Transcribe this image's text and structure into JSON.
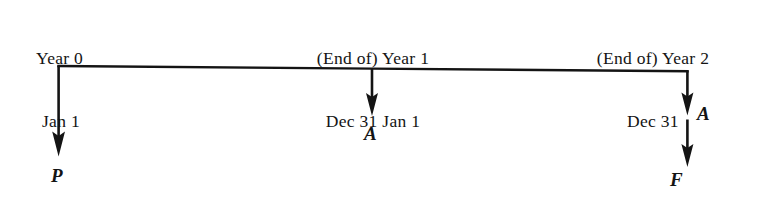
{
  "diagram": {
    "kind": "cash-flow-timeline",
    "ink_color": "#141414",
    "background_color": "#ffffff",
    "timeline": {
      "axis_y": 67,
      "start_x": 58,
      "end_x": 687
    },
    "period_labels": [
      {
        "id": "year0",
        "line1": "Year 0",
        "line2": "Jan 1",
        "align": "left"
      },
      {
        "id": "year1",
        "line1": "(End of) Year 1",
        "line2": "Dec 31 Jan 1",
        "align": "center"
      },
      {
        "id": "year2",
        "line1": "(End of) Year 2",
        "line2": "Dec 31",
        "align": "center"
      }
    ],
    "cash_flows": [
      {
        "id": "p",
        "symbol": "P",
        "meaning": "present-worth",
        "at_x": 58,
        "tip_y": 153,
        "label_position": "below"
      },
      {
        "id": "a-year1",
        "symbol": "A",
        "meaning": "annual-amount",
        "at_x": 372,
        "tip_y": 113,
        "label_position": "below"
      },
      {
        "id": "a-year2",
        "symbol": "A",
        "meaning": "annual-amount",
        "at_x": 687,
        "tip_y": 112,
        "label_position": "right"
      },
      {
        "id": "f",
        "symbol": "F",
        "meaning": "future-worth",
        "at_x": 687,
        "tip_y": 164,
        "label_position": "below"
      }
    ]
  }
}
